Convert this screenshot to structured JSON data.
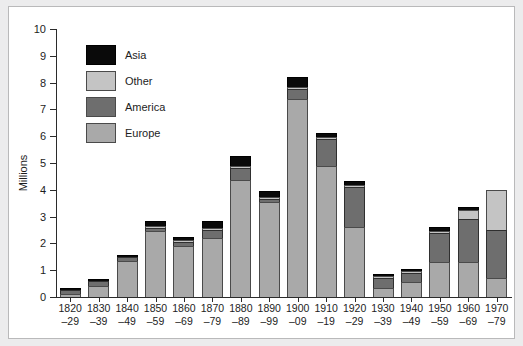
{
  "chart_data": {
    "type": "bar",
    "stacked": true,
    "title": "",
    "subtitle": "",
    "xlabel": "",
    "ylabel": "Millions",
    "ylim": [
      0,
      10
    ],
    "ytick_labels": [
      "0",
      "1",
      "2",
      "3",
      "4",
      "5",
      "6",
      "7",
      "8",
      "9",
      "10"
    ],
    "ytick_values": [
      0,
      1,
      2,
      3,
      4,
      5,
      6,
      7,
      8,
      9,
      10
    ],
    "grid": false,
    "legend_position": "upper-left-inside",
    "categories": [
      "1820–29",
      "1830–39",
      "1840–49",
      "1850–59",
      "1860–69",
      "1870–79",
      "1880–89",
      "1890–99",
      "1900–09",
      "1910–19",
      "1920–29",
      "1930–39",
      "1940–49",
      "1950–59",
      "1960–69",
      "1970–79"
    ],
    "category_lines": [
      [
        "1820",
        "–29"
      ],
      [
        "1830",
        "–39"
      ],
      [
        "1840",
        "–49"
      ],
      [
        "1850",
        "–59"
      ],
      [
        "1860",
        "–69"
      ],
      [
        "1870",
        "–79"
      ],
      [
        "1880",
        "–89"
      ],
      [
        "1890",
        "–99"
      ],
      [
        "1900",
        "–09"
      ],
      [
        "1910",
        "–19"
      ],
      [
        "1920",
        "–29"
      ],
      [
        "1930",
        "–39"
      ],
      [
        "1940",
        "–49"
      ],
      [
        "1950",
        "–59"
      ],
      [
        "1960",
        "–69"
      ],
      [
        "1970",
        "–79"
      ]
    ],
    "series": [
      {
        "name": "Europe",
        "color": "#a9a9a9",
        "values": [
          0.1,
          0.42,
          1.35,
          2.45,
          1.9,
          2.2,
          4.35,
          3.55,
          7.4,
          4.9,
          2.6,
          0.35,
          0.55,
          1.3,
          1.3,
          0.7
        ]
      },
      {
        "name": "America",
        "color": "#6e6e6e",
        "values": [
          0.18,
          0.16,
          0.13,
          0.12,
          0.15,
          0.3,
          0.45,
          0.1,
          0.35,
          1.0,
          1.5,
          0.35,
          0.35,
          1.1,
          1.6,
          1.8
        ]
      },
      {
        "name": "Other",
        "color": "#c4c4c4",
        "values": [
          0.0,
          0.0,
          0.0,
          0.02,
          0.02,
          0.02,
          0.02,
          0.02,
          0.05,
          0.05,
          0.05,
          0.02,
          0.02,
          0.05,
          0.35,
          1.5
        ]
      },
      {
        "name": "Asia",
        "color": "#0a0a0a",
        "values": [
          0.02,
          0.02,
          0.02,
          0.21,
          0.13,
          0.28,
          0.38,
          0.23,
          0.4,
          0.15,
          0.15,
          0.08,
          0.08,
          0.15,
          0.1,
          0.0
        ]
      }
    ],
    "totals": [
      0.3,
      0.6,
      1.5,
      2.8,
      2.2,
      2.8,
      5.2,
      3.9,
      8.2,
      6.1,
      4.3,
      0.8,
      1.0,
      2.6,
      3.35,
      4.0
    ]
  },
  "legend": {
    "items": [
      {
        "label": "Asia",
        "color": "#0a0a0a"
      },
      {
        "label": "Other",
        "color": "#c4c4c4"
      },
      {
        "label": "America",
        "color": "#6e6e6e"
      },
      {
        "label": "Europe",
        "color": "#a9a9a9"
      }
    ]
  },
  "colors": {
    "background": "#ececed",
    "plot_background": "#ffffff",
    "axis": "#2b2b2b",
    "text": "#1d1d1d",
    "frame_border": "#b9b9ba"
  }
}
